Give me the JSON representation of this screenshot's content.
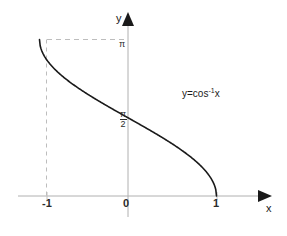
{
  "figure": {
    "title": "",
    "background_color": "#ffffff",
    "axis_color": "#aaaaaa",
    "curve_color": "#1a1a1a",
    "dashed_color": "#bbbbbb",
    "label_color": "#1a1a1a"
  },
  "labels": {
    "y_axis_name": "y",
    "x_axis_name": "x",
    "function": "y=cos",
    "function_exponent": "-1",
    "function_variable": "x",
    "tick_neg1": "-1",
    "tick_zero": "0",
    "tick_one": "1",
    "tick_pi": "π",
    "tick_pi_over_2_num": "π",
    "tick_pi_over_2_den": "2",
    "watermark": ""
  },
  "chart_data": {
    "type": "line",
    "title": "",
    "subtitle": "",
    "xlabel": "x",
    "ylabel": "y",
    "xlim": [
      -1.45,
      1.7
    ],
    "ylim": [
      -0.35,
      3.6
    ],
    "grid": false,
    "legend": null,
    "xticks": [
      -1,
      0,
      1
    ],
    "xticklabels": [
      "-1",
      "0",
      "1"
    ],
    "yticks": [
      1.5707963,
      3.1415927
    ],
    "yticklabels": [
      "π/2",
      "π"
    ],
    "annotations": [
      {
        "text": "y=cos⁻¹x",
        "x": 0.65,
        "y": 2.1
      }
    ],
    "guides": [
      {
        "type": "dashed-horizontal",
        "from": [
          -1,
          3.1415927
        ],
        "to": [
          0,
          3.1415927
        ]
      },
      {
        "type": "dashed-vertical",
        "from": [
          -1,
          0
        ],
        "to": [
          -1,
          3.1415927
        ]
      }
    ],
    "series": [
      {
        "name": "y=cos⁻¹x",
        "expression": "arccos(x)",
        "domain": [
          -1,
          1
        ],
        "range": [
          0,
          3.1415927
        ],
        "x": [
          -1.0,
          -0.95,
          -0.9,
          -0.85,
          -0.8,
          -0.7,
          -0.6,
          -0.5,
          -0.4,
          -0.3,
          -0.2,
          -0.1,
          0.0,
          0.1,
          0.2,
          0.3,
          0.4,
          0.5,
          0.6,
          0.7,
          0.8,
          0.85,
          0.9,
          0.95,
          1.0
        ],
        "values": [
          3.1416,
          2.8228,
          2.6906,
          2.5913,
          2.4981,
          2.3462,
          2.2143,
          2.0944,
          1.9823,
          1.8755,
          1.7722,
          1.671,
          1.5708,
          1.4706,
          1.3694,
          1.2661,
          1.1593,
          1.0472,
          0.9273,
          0.7954,
          0.6435,
          0.5548,
          0.451,
          0.3176,
          0.0
        ]
      }
    ]
  }
}
